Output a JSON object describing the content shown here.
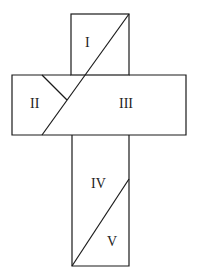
{
  "diagram": {
    "type": "cross-dissection",
    "stroke_color": "#1a1a1a",
    "regions": [
      {
        "id": "I",
        "label": "I"
      },
      {
        "id": "II",
        "label": "II"
      },
      {
        "id": "III",
        "label": "III"
      },
      {
        "id": "IV",
        "label": "IV"
      },
      {
        "id": "V",
        "label": "V"
      }
    ]
  }
}
